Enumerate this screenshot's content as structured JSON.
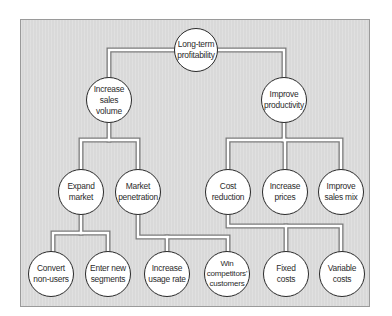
{
  "diagram": {
    "type": "tree",
    "colors": {
      "background": "#d9d9d9",
      "node_fill": "#ffffff",
      "node_border": "#2a2a2a",
      "connector_fill": "#ffffff",
      "connector_outline": "#7a7a7a"
    },
    "nodes": {
      "root": {
        "label": "Long-term\nprofitability"
      },
      "sales_volume": {
        "label": "Increase\nsales\nvolume"
      },
      "productivity": {
        "label": "Improve\nproductivity"
      },
      "expand_market": {
        "label": "Expand\nmarket"
      },
      "market_penetration": {
        "label": "Market\npenetration"
      },
      "cost_reduction": {
        "label": "Cost\nreduction"
      },
      "increase_prices": {
        "label": "Increase\nprices"
      },
      "improve_sales_mix": {
        "label": "Improve\nsales mix"
      },
      "convert_non_users": {
        "label": "Convert\nnon-users"
      },
      "enter_new_segments": {
        "label": "Enter new\nsegments"
      },
      "increase_usage_rate": {
        "label": "Increase\nusage rate"
      },
      "win_competitors_customers": {
        "label": "Win\ncompetitors'\ncustomers"
      },
      "fixed_costs": {
        "label": "Fixed\ncosts"
      },
      "variable_costs": {
        "label": "Variable\ncosts"
      }
    },
    "edges": [
      [
        "root",
        "sales_volume"
      ],
      [
        "root",
        "productivity"
      ],
      [
        "sales_volume",
        "expand_market"
      ],
      [
        "sales_volume",
        "market_penetration"
      ],
      [
        "productivity",
        "cost_reduction"
      ],
      [
        "productivity",
        "increase_prices"
      ],
      [
        "productivity",
        "improve_sales_mix"
      ],
      [
        "expand_market",
        "convert_non_users"
      ],
      [
        "expand_market",
        "enter_new_segments"
      ],
      [
        "market_penetration",
        "increase_usage_rate"
      ],
      [
        "market_penetration",
        "win_competitors_customers"
      ],
      [
        "cost_reduction",
        "fixed_costs"
      ],
      [
        "cost_reduction",
        "variable_costs"
      ]
    ]
  }
}
